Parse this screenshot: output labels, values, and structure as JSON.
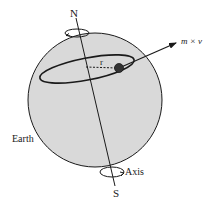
{
  "diagram": {
    "labels": {
      "north": "N",
      "south": "S",
      "radius": "r",
      "momentum": "m × v",
      "earth": "Earth",
      "axis": "Axis"
    },
    "colors": {
      "sphere_fill": "#d9d9d9",
      "stroke": "#1a1a1a",
      "background": "#ffffff"
    }
  }
}
